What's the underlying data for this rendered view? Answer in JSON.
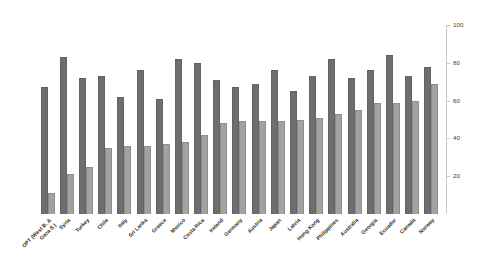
{
  "chart_data": {
    "type": "bar",
    "title": "",
    "subtitle": "",
    "xlabel": "",
    "ylabel": "",
    "ylim": [
      0,
      100
    ],
    "grid": false,
    "legend": "none",
    "y_axis_position": "right",
    "y_ticks": [
      20,
      40,
      60,
      80,
      100
    ],
    "categories": [
      "OPT (West B. & Gaza S.)",
      "Syria",
      "Turkey",
      "Chile",
      "Italy",
      "Sri Lanka",
      "Greece",
      "Mexico",
      "Costa Rica",
      "Ireland",
      "Germany",
      "Austria",
      "Japan",
      "Latvia",
      "Hong Kong",
      "Philippines",
      "Australia",
      "Georgia",
      "Ecuador",
      "Canada",
      "Norway"
    ],
    "category_lines": [
      [
        "OPT (West B. &",
        "Gaza S.)"
      ],
      [
        "Syria"
      ],
      [
        "Turkey"
      ],
      [
        "Chile"
      ],
      [
        "Italy"
      ],
      [
        "Sri Lanka"
      ],
      [
        "Greece"
      ],
      [
        "Mexico"
      ],
      [
        "Costa Rica"
      ],
      [
        "Ireland"
      ],
      [
        "Germany"
      ],
      [
        "Austria"
      ],
      [
        "Japan"
      ],
      [
        "Latvia"
      ],
      [
        "Hong Kong"
      ],
      [
        "Philippines"
      ],
      [
        "Australia"
      ],
      [
        "Georgia"
      ],
      [
        "Ecuador"
      ],
      [
        "Canada"
      ],
      [
        "Norway"
      ]
    ],
    "series": [
      {
        "name": "series-1",
        "color": "#6e6e6e",
        "values": [
          67,
          83,
          72,
          73,
          62,
          76,
          61,
          82,
          80,
          71,
          67,
          69,
          76,
          65,
          73,
          82,
          72,
          76,
          84,
          73,
          78
        ]
      },
      {
        "name": "series-2",
        "color": "#a2a2a2",
        "values": [
          11,
          21,
          25,
          35,
          36,
          36,
          37,
          38,
          42,
          48,
          49,
          49,
          49,
          50,
          51,
          53,
          55,
          59,
          59,
          60,
          69
        ]
      }
    ]
  }
}
